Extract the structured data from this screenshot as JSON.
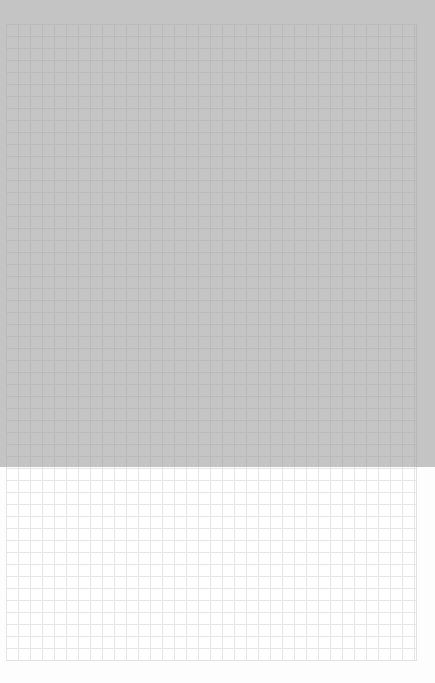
{
  "image": {
    "description": "Sheet of square grid paper, upper portion shaded gray",
    "grid_cell_px": 12,
    "colors": {
      "paper": "#ffffff",
      "grid_line": "#e6e6e6",
      "shade": "#c4c4c4"
    }
  }
}
